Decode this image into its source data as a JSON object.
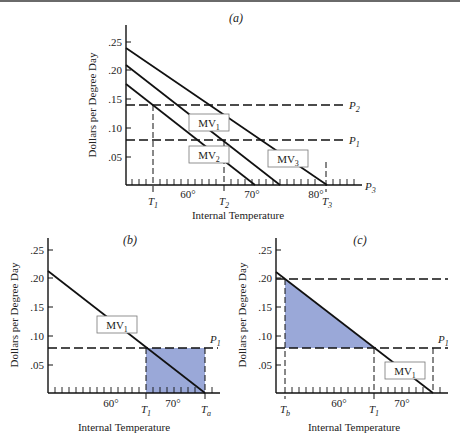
{
  "figure": {
    "panels": [
      {
        "id": "a",
        "title": "(a)",
        "ylabel": "Dollars per Degree Day",
        "xlabel": "Internal Temperature",
        "yticks": [
          ".25",
          ".20",
          ".15",
          ".10",
          ".05"
        ],
        "xtick_labels": [
          "60°",
          "70°",
          "80°"
        ],
        "markers": [
          "T1",
          "T2",
          "T3"
        ],
        "price_lines": [
          "P2",
          "P1",
          "P3"
        ],
        "curves": [
          "MV1",
          "MV2",
          "MV3"
        ]
      },
      {
        "id": "b",
        "title": "(b)",
        "ylabel": "Dollars per Degree Day",
        "xlabel": "Internal Temperature",
        "yticks": [
          ".25",
          ".20",
          ".15",
          ".10",
          ".05"
        ],
        "xtick_labels": [
          "60°",
          "70°"
        ],
        "markers": [
          "T1",
          "Ta"
        ],
        "price_lines": [
          "P1"
        ],
        "curves": [
          "MV1"
        ]
      },
      {
        "id": "c",
        "title": "(c)",
        "ylabel": "Dollars per Degree Day",
        "xlabel": "Internal Temperature",
        "yticks": [
          ".25",
          ".20",
          ".15",
          ".10",
          ".05"
        ],
        "xtick_labels": [
          "60°",
          "70°"
        ],
        "markers": [
          "Tb",
          "T1"
        ],
        "price_lines": [
          "P1"
        ],
        "curves": [
          "MV1"
        ]
      }
    ],
    "colors": {
      "shade": "#9aa8d8",
      "line": "#111111"
    }
  }
}
